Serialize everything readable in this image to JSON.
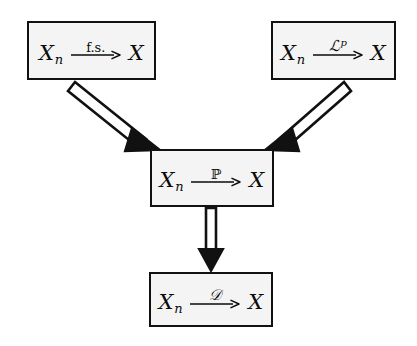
{
  "diagram": {
    "background_color": "#ffffff",
    "box_fill_color": "#f4f4f4",
    "line_color": "#111111",
    "nodes": [
      {
        "id": "almost-sure",
        "position": "top-left",
        "left_term": "X",
        "left_subscript": "n",
        "arrow_label": "f.s.",
        "label_style": "roman",
        "right_term": "X",
        "reading": "X_n --f.s.--> X"
      },
      {
        "id": "lp",
        "position": "top-right",
        "left_term": "X",
        "left_subscript": "n",
        "arrow_label": "ℒ",
        "arrow_label_superscript": "p",
        "label_style": "script",
        "right_term": "X",
        "reading": "X_n --L^p--> X"
      },
      {
        "id": "probability",
        "position": "middle",
        "left_term": "X",
        "left_subscript": "n",
        "arrow_label": "ℙ",
        "label_style": "blackboard",
        "right_term": "X",
        "reading": "X_n --P--> X"
      },
      {
        "id": "distribution",
        "position": "bottom",
        "left_term": "X",
        "left_subscript": "n",
        "arrow_label": "𝒟",
        "label_style": "script",
        "right_term": "X",
        "reading": "X_n --D--> X"
      }
    ],
    "implications": [
      {
        "id": "as-to-prob",
        "from": "almost-sure",
        "to": "probability",
        "style": "double-line-arrow",
        "direction": "down-right"
      },
      {
        "id": "lp-to-prob",
        "from": "lp",
        "to": "probability",
        "style": "double-line-arrow",
        "direction": "down-left"
      },
      {
        "id": "prob-to-dist",
        "from": "probability",
        "to": "distribution",
        "style": "double-line-arrow",
        "direction": "down"
      }
    ]
  }
}
